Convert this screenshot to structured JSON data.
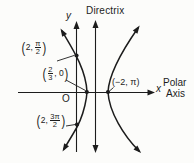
{
  "figure": {
    "background": "#fcfcfa",
    "ink": "#1c1c1c",
    "directrix_label": "Directrix",
    "y_axis_label": "y",
    "x_axis_label": "x",
    "polar_axis_line1": "Polar",
    "polar_axis_line2": "Axis",
    "origin_label": "O",
    "points": {
      "top": {
        "open": "(",
        "pre": "2,",
        "num": "π",
        "den": "2",
        "close": ")"
      },
      "vertex_near": {
        "open": "(",
        "num": "2",
        "den": "3",
        "post": ", 0",
        "close": ")"
      },
      "vertex_far": {
        "text": "(−2, π)"
      },
      "bottom": {
        "open": "(",
        "pre": "2,",
        "num": "3π",
        "den": "2",
        "close": ")"
      }
    }
  }
}
